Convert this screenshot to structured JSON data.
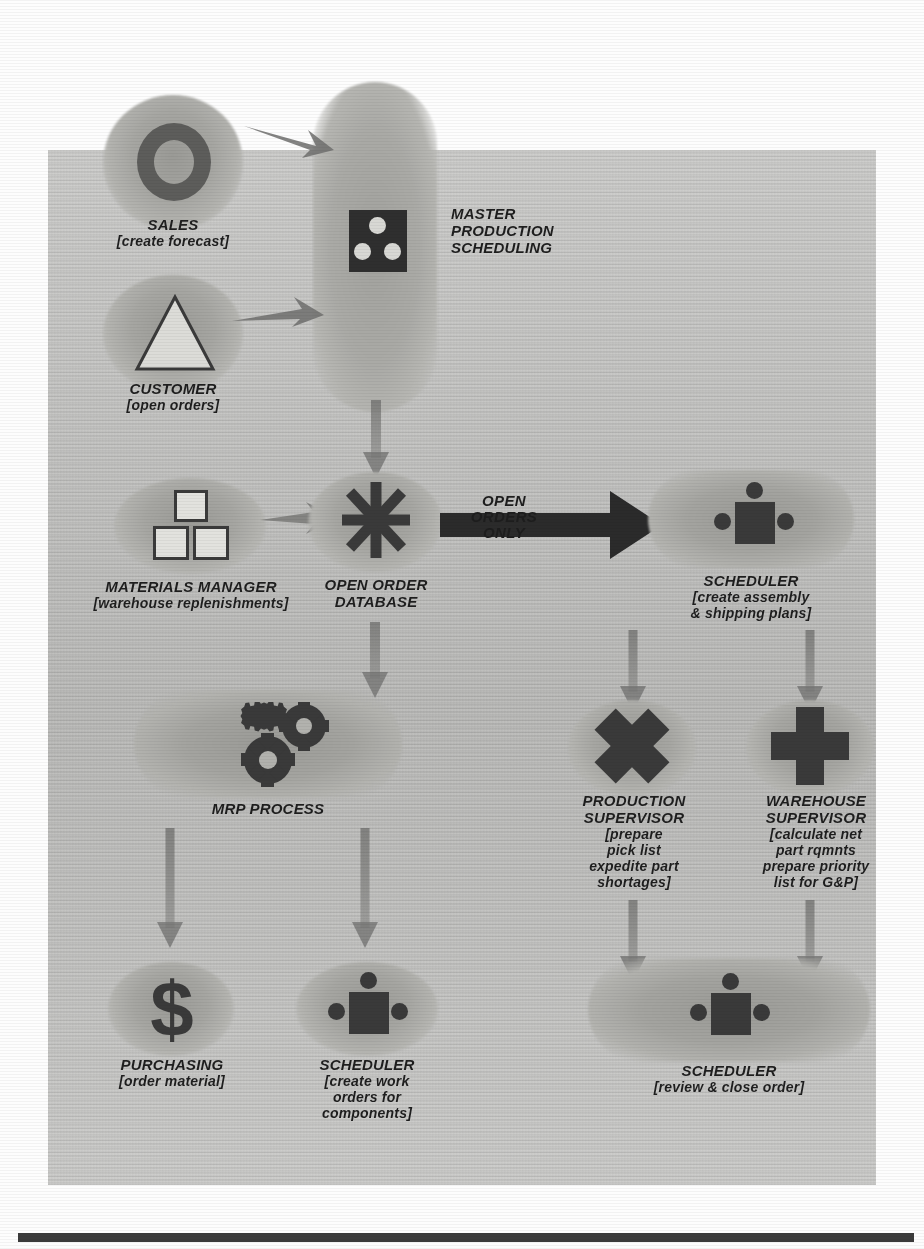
{
  "figure": {
    "kind": "process-flow-diagram",
    "palette": {
      "panel_gray": "#c4c4c2",
      "blob_gray": "#a6a6a2",
      "glyph_dark": "#3a3a3a",
      "arrow_black": "#2b2b2b",
      "text_dark": "#1e1e1e",
      "rule_bar": "#3b3b3b",
      "page_white": "#fdfdfd"
    }
  },
  "nodes": [
    {
      "id": "sales",
      "icon": "ring-icon",
      "title": "SALES",
      "subtitle": "[create forecast]"
    },
    {
      "id": "customer",
      "icon": "triangle-icon",
      "title": "CUSTOMER",
      "subtitle": "[open orders]"
    },
    {
      "id": "master-production-scheduling",
      "icon": "dice-three-icon",
      "title": "MASTER\nPRODUCTION\nSCHEDULING",
      "subtitle": ""
    },
    {
      "id": "materials-manager",
      "icon": "blocks-icon",
      "title": "MATERIALS MANAGER",
      "subtitle": "[warehouse replenishments]"
    },
    {
      "id": "open-order-database",
      "icon": "asterisk-icon",
      "title": "OPEN ORDER\nDATABASE",
      "subtitle": ""
    },
    {
      "id": "scheduler-assembly",
      "icon": "person-table-icon",
      "title": "SCHEDULER",
      "subtitle": "[create assembly\n& shipping plans]"
    },
    {
      "id": "mrp-process",
      "icon": "gears-icon",
      "title": "MRP PROCESS",
      "subtitle": ""
    },
    {
      "id": "production-supervisor",
      "icon": "cross-x-icon",
      "title": "PRODUCTION\nSUPERVISOR",
      "subtitle": "[prepare\npick list\nexpedite part\nshortages]"
    },
    {
      "id": "warehouse-supervisor",
      "icon": "plus-icon",
      "title": "WAREHOUSE\nSUPERVISOR",
      "subtitle": "[calculate net\npart rqmnts\nprepare priority\nlist for G&P]"
    },
    {
      "id": "purchasing",
      "icon": "dollar-sign-icon",
      "title": "PURCHASING",
      "subtitle": "[order material]"
    },
    {
      "id": "scheduler-work-orders",
      "icon": "person-table-icon",
      "title": "SCHEDULER",
      "subtitle": "[create work\norders for\ncomponents]"
    },
    {
      "id": "scheduler-close-order",
      "icon": "person-table-icon",
      "title": "SCHEDULER",
      "subtitle": "[review & close order]"
    }
  ],
  "connectors": [
    {
      "id": "sales-to-mps",
      "label": "",
      "style": "diagonal-arrow"
    },
    {
      "id": "customer-to-mps",
      "label": "",
      "style": "diagonal-arrow"
    },
    {
      "id": "mps-to-open-order-database",
      "label": "",
      "style": "down-arrow"
    },
    {
      "id": "materials-manager-to-open-order-database",
      "label": "",
      "style": "right-arrow"
    },
    {
      "id": "open-order-database-to-scheduler",
      "label": "OPEN\nORDERS\nONLY",
      "style": "bold-right-arrow"
    },
    {
      "id": "open-order-database-to-mrp",
      "label": "",
      "style": "down-arrow"
    },
    {
      "id": "scheduler-to-production-supervisor",
      "label": "",
      "style": "down-arrow"
    },
    {
      "id": "scheduler-to-warehouse-supervisor",
      "label": "",
      "style": "down-arrow"
    },
    {
      "id": "mrp-to-purchasing",
      "label": "",
      "style": "down-arrow"
    },
    {
      "id": "mrp-to-scheduler-work-orders",
      "label": "",
      "style": "down-arrow"
    },
    {
      "id": "production-supervisor-to-scheduler-close",
      "label": "",
      "style": "down-arrow"
    },
    {
      "id": "warehouse-supervisor-to-scheduler-close",
      "label": "",
      "style": "down-arrow"
    }
  ],
  "arrow_labels": {
    "open_orders_only": "OPEN\nORDERS\nONLY"
  }
}
